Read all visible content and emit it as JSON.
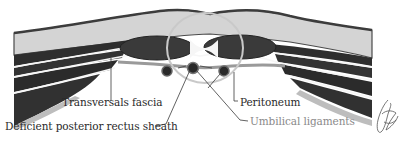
{
  "figure": {
    "type": "anatomical cross-section",
    "labels": {
      "transversals_fascia": "Transversals fascia",
      "deficient_posterior_rectus_sheath": "Deficient posterior rectus sheath",
      "peritoneum": "Peritoneum",
      "umbilical_ligaments": "Umbilical ligaments"
    },
    "signature": "artist-signature"
  },
  "colors": {
    "background": "#ffffff",
    "skin_outline": "#4a4a4a",
    "subcutaneous_fat": "#d4d4d4",
    "muscle_dark": "#2e2e2e",
    "fascia_light": "#f4f4f4",
    "rectus_muscle": "#3a3a3a",
    "peritoneum_layer": "#bdbdbd",
    "highlight_circle": "#c9c9c9",
    "label_text": "#2a2a2a",
    "label_text_muted": "#8a8a8a",
    "leader_line": "#3a3a3a"
  }
}
